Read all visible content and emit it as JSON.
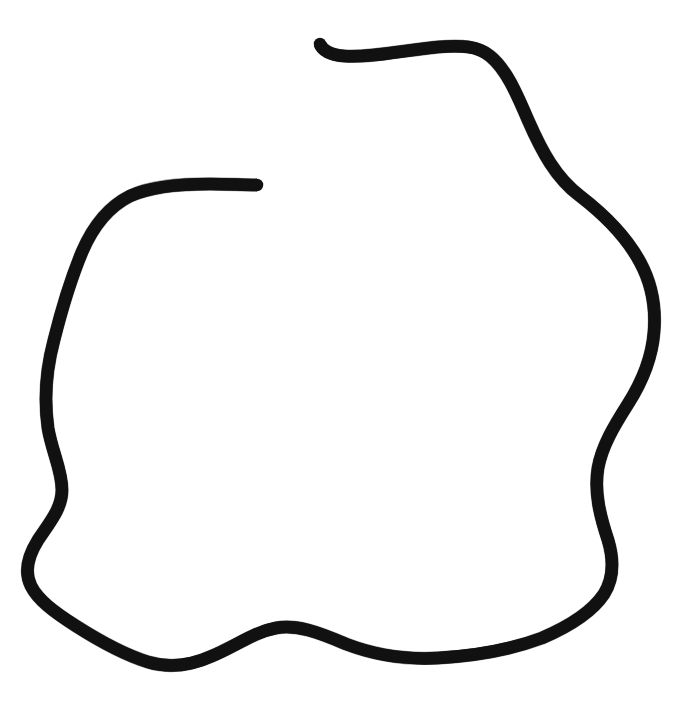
{
  "canvas": {
    "width": 696,
    "height": 714,
    "background_color": "#ffffff",
    "title": "Hand-drawn open loop outline"
  },
  "drawing": {
    "description": "A single hand-drawn black ink stroke forming a large, irregular, nearly-closed rounded blob that fills most of the frame. The loop does not close: both free ends sit in the upper portion of the image, leaving a gap along the top-left.",
    "stroke_color": "#111111",
    "stroke_width_px": 12.5,
    "stroke_linecap": "butt",
    "closed": false,
    "style": "rough ink / marker, slightly textured edges",
    "bounding_box": {
      "x_min": 28,
      "y_min": 40,
      "x_max": 658,
      "y_max": 668
    },
    "endpoints": [
      {
        "name": "hooked-end",
        "x": 320,
        "y": 44,
        "shape": "small upward hook / curl",
        "location": "top-center, left of the top ridge"
      },
      {
        "name": "blunt-end",
        "x": 257,
        "y": 185,
        "shape": "blunt angled cut",
        "location": "upper-left interior, pointing up-right"
      }
    ],
    "extrema": [
      {
        "name": "topmost",
        "x": 400,
        "y": 42
      },
      {
        "name": "rightmost",
        "x": 654,
        "y": 330
      },
      {
        "name": "bottommost",
        "x": 168,
        "y": 666
      },
      {
        "name": "leftmost",
        "x": 30,
        "y": 600
      }
    ],
    "features": [
      "top ridge runs nearly horizontally from the hooked end rightward to about x=480",
      "sharp shoulder turn down at the upper right near (490, 55)",
      "right side bulges outward reaching its widest near (654, 330)",
      "right side tucks back inward around (600, 470) before the lower right corner",
      "bottom edge carries a pronounced S-wave between x=180 and x=430",
      "left side shows an inflection notch near (62, 490)",
      "upper-left arc rises to meet the blunt end at (257, 185)"
    ],
    "path_d": "M 320 44 C 322 50 330 55 344 56 C 372 58 404 50 438 47 C 462 45 478 46 490 56 C 506 69 516 92 528 120 C 542 152 556 178 580 196 C 606 216 626 236 640 262 C 652 284 656 308 654 332 C 652 358 642 382 628 404 C 614 426 602 446 598 468 C 594 492 600 516 608 540 C 614 560 614 578 604 594 C 592 612 570 626 542 638 C 510 650 474 656 438 658 C 402 660 372 654 346 644 C 318 632 296 624 276 628 C 254 632 236 646 212 656 C 190 666 168 668 148 662 C 122 654 98 640 76 626 C 54 612 38 600 31 586 C 24 572 28 556 38 540 C 50 522 62 508 62 490 C 62 470 52 452 48 428 C 44 400 46 370 54 340 C 62 308 72 276 82 252 C 94 224 110 206 130 196 C 152 186 180 184 210 184 C 228 184 244 185 257 185"
  },
  "a11y": {
    "alt_text": "A large hand-drawn black outline of an irregular rounded blob, open at the top with two free ends."
  }
}
